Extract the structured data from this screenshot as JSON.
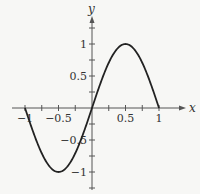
{
  "chart_data": {
    "type": "line",
    "title": "",
    "xlabel": "x",
    "ylabel": "y",
    "xlim": [
      -1,
      1
    ],
    "ylim": [
      -1,
      1
    ],
    "x_ticks": [
      -1,
      -0.5,
      0.5,
      1
    ],
    "x_tick_labels": [
      "-1",
      "-0.5",
      "0.5",
      "1"
    ],
    "y_ticks": [
      -1,
      -0.5,
      0.5,
      1
    ],
    "y_tick_labels": [
      "-1",
      "-0.5",
      "0.5",
      "1"
    ],
    "minor_tick_step": 0.25,
    "grid": false,
    "series": [
      {
        "name": "y = sin(pi x)",
        "x": [
          -1,
          -0.75,
          -0.5,
          -0.25,
          0,
          0.25,
          0.5,
          0.75,
          1
        ],
        "y": [
          0,
          -0.71,
          -1,
          -0.71,
          0,
          0.71,
          1,
          0.71,
          0
        ]
      }
    ],
    "color": "#222222"
  },
  "axes": {
    "x_label": "x",
    "y_label": "y"
  }
}
